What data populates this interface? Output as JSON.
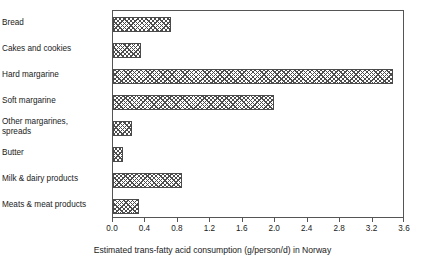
{
  "chart_data": {
    "type": "bar",
    "orientation": "horizontal",
    "title": "",
    "xlabel": "Estimated trans-fatty acid consumption (g/person/d) in Norway",
    "ylabel": "",
    "categories": [
      "Bread",
      "Cakes and cookies",
      "Hard margarine",
      "Soft margarine",
      "Other margarines,\nspreads",
      "Butter",
      "Milk & dairy products",
      "Meats & meat products"
    ],
    "values": [
      0.72,
      0.35,
      3.45,
      1.98,
      0.23,
      0.12,
      0.85,
      0.32
    ],
    "xlim": [
      0.0,
      3.6
    ],
    "xticks": [
      0.0,
      0.4,
      0.8,
      1.2,
      1.6,
      2.0,
      2.4,
      2.8,
      3.2,
      3.6
    ],
    "xtick_labels": [
      "0.0",
      "0.4",
      "0.8",
      "1.2",
      "1.6",
      "2.0",
      "2.4",
      "2.8",
      "3.2",
      "3.6"
    ],
    "grid": false,
    "legend": null,
    "bar_fill": "crosshatch",
    "bar_edge_color": "#4a4a4a",
    "frame_color": "#555555"
  }
}
